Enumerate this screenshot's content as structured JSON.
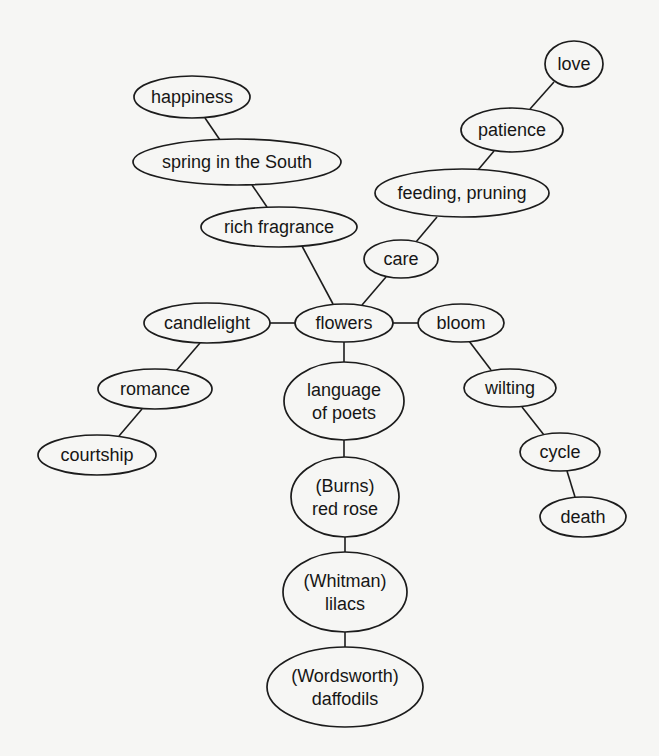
{
  "diagram": {
    "type": "concept-map",
    "center": "flowers",
    "colors": {
      "background": "#f6f6f4",
      "stroke": "#1c1c1c",
      "text": "#161616"
    },
    "nodes": [
      {
        "id": "love",
        "lines": [
          "love"
        ],
        "cx": 574,
        "cy": 64,
        "rx": 29,
        "ry": 23
      },
      {
        "id": "patience",
        "lines": [
          "patience"
        ],
        "cx": 512,
        "cy": 130,
        "rx": 51,
        "ry": 22
      },
      {
        "id": "feeding-pruning",
        "lines": [
          "feeding, pruning"
        ],
        "cx": 462,
        "cy": 193,
        "rx": 87,
        "ry": 24
      },
      {
        "id": "happiness",
        "lines": [
          "happiness"
        ],
        "cx": 192,
        "cy": 97,
        "rx": 58,
        "ry": 21
      },
      {
        "id": "spring-in-the-south",
        "lines": [
          "spring in the South"
        ],
        "cx": 237,
        "cy": 162,
        "rx": 104,
        "ry": 23
      },
      {
        "id": "rich-fragrance",
        "lines": [
          "rich fragrance"
        ],
        "cx": 279,
        "cy": 227,
        "rx": 78,
        "ry": 20
      },
      {
        "id": "care",
        "lines": [
          "care"
        ],
        "cx": 401,
        "cy": 259,
        "rx": 37,
        "ry": 19
      },
      {
        "id": "candlelight",
        "lines": [
          "candlelight"
        ],
        "cx": 207,
        "cy": 323,
        "rx": 63,
        "ry": 20
      },
      {
        "id": "flowers",
        "lines": [
          "flowers"
        ],
        "cx": 344,
        "cy": 323,
        "rx": 49,
        "ry": 19
      },
      {
        "id": "bloom",
        "lines": [
          "bloom"
        ],
        "cx": 461,
        "cy": 323,
        "rx": 43,
        "ry": 19
      },
      {
        "id": "romance",
        "lines": [
          "romance"
        ],
        "cx": 155,
        "cy": 389,
        "rx": 57,
        "ry": 20
      },
      {
        "id": "courtship",
        "lines": [
          "courtship"
        ],
        "cx": 97,
        "cy": 455,
        "rx": 59,
        "ry": 20
      },
      {
        "id": "language-of-poets",
        "lines": [
          "language",
          "of poets"
        ],
        "cx": 344,
        "cy": 401,
        "rx": 60,
        "ry": 39
      },
      {
        "id": "wilting",
        "lines": [
          "wilting"
        ],
        "cx": 510,
        "cy": 388,
        "rx": 46,
        "ry": 19
      },
      {
        "id": "cycle",
        "lines": [
          "cycle"
        ],
        "cx": 560,
        "cy": 452,
        "rx": 40,
        "ry": 19
      },
      {
        "id": "death",
        "lines": [
          "death"
        ],
        "cx": 583,
        "cy": 517,
        "rx": 43,
        "ry": 20
      },
      {
        "id": "burns-red-rose",
        "lines": [
          "(Burns)",
          "red rose"
        ],
        "cx": 345,
        "cy": 497,
        "rx": 54,
        "ry": 40
      },
      {
        "id": "whitman-lilacs",
        "lines": [
          "(Whitman)",
          "lilacs"
        ],
        "cx": 345,
        "cy": 592,
        "rx": 62,
        "ry": 40
      },
      {
        "id": "wordsworth-daffodils",
        "lines": [
          "(Wordsworth)",
          "daffodils"
        ],
        "cx": 345,
        "cy": 687,
        "rx": 78,
        "ry": 40
      }
    ],
    "edges": [
      {
        "from": "love",
        "to": "patience",
        "x1": 554,
        "y1": 82,
        "x2": 530,
        "y2": 109
      },
      {
        "from": "patience",
        "to": "feeding-pruning",
        "x1": 494,
        "y1": 151,
        "x2": 478,
        "y2": 170
      },
      {
        "from": "feeding-pruning",
        "to": "care",
        "x1": 437,
        "y1": 217,
        "x2": 416,
        "y2": 242
      },
      {
        "from": "care",
        "to": "flowers",
        "x1": 386,
        "y1": 277,
        "x2": 362,
        "y2": 305
      },
      {
        "from": "happiness",
        "to": "spring-in-the-south",
        "x1": 205,
        "y1": 118,
        "x2": 220,
        "y2": 140
      },
      {
        "from": "spring-in-the-south",
        "to": "rich-fragrance",
        "x1": 252,
        "y1": 185,
        "x2": 267,
        "y2": 207
      },
      {
        "from": "rich-fragrance",
        "to": "flowers",
        "x1": 302,
        "y1": 246,
        "x2": 333,
        "y2": 304
      },
      {
        "from": "candlelight",
        "to": "flowers",
        "x1": 270,
        "y1": 323,
        "x2": 295,
        "y2": 323
      },
      {
        "from": "flowers",
        "to": "bloom",
        "x1": 393,
        "y1": 323,
        "x2": 418,
        "y2": 323
      },
      {
        "from": "candlelight",
        "to": "romance",
        "x1": 200,
        "y1": 343,
        "x2": 176,
        "y2": 371
      },
      {
        "from": "romance",
        "to": "courtship",
        "x1": 142,
        "y1": 409,
        "x2": 119,
        "y2": 436
      },
      {
        "from": "flowers",
        "to": "language-of-poets",
        "x1": 344,
        "y1": 342,
        "x2": 344,
        "y2": 362
      },
      {
        "from": "bloom",
        "to": "wilting",
        "x1": 469,
        "y1": 341,
        "x2": 491,
        "y2": 370
      },
      {
        "from": "wilting",
        "to": "cycle",
        "x1": 522,
        "y1": 407,
        "x2": 544,
        "y2": 435
      },
      {
        "from": "cycle",
        "to": "death",
        "x1": 567,
        "y1": 471,
        "x2": 575,
        "y2": 497
      },
      {
        "from": "language-of-poets",
        "to": "burns-red-rose",
        "x1": 344,
        "y1": 440,
        "x2": 344,
        "y2": 457
      },
      {
        "from": "burns-red-rose",
        "to": "whitman-lilacs",
        "x1": 345,
        "y1": 537,
        "x2": 345,
        "y2": 552
      },
      {
        "from": "whitman-lilacs",
        "to": "wordsworth-daffodils",
        "x1": 345,
        "y1": 632,
        "x2": 345,
        "y2": 647
      }
    ]
  }
}
